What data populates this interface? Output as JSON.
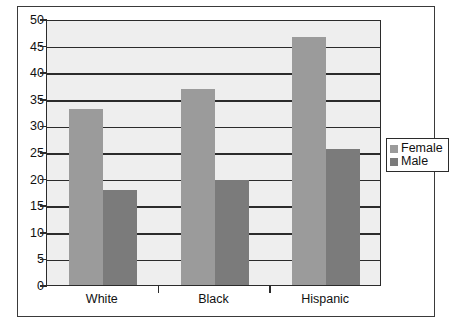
{
  "chart_data": {
    "type": "bar",
    "title": "",
    "subtitle": "",
    "xlabel": "",
    "ylabel": "",
    "categories": [
      "White",
      "Black",
      "Hispanic"
    ],
    "series": [
      {
        "name": "Female",
        "color": "#9b9b9b",
        "values": [
          33.1,
          36.9,
          46.6
        ]
      },
      {
        "name": "Male",
        "color": "#7b7b7b",
        "values": [
          17.9,
          19.7,
          25.5
        ]
      }
    ],
    "ylim": [
      0,
      50
    ],
    "yticks": [
      0,
      5,
      10,
      15,
      20,
      25,
      30,
      35,
      40,
      45,
      50
    ],
    "ytick_labels": [
      "0",
      "5",
      "10",
      "15",
      "20",
      "25",
      "30",
      "35",
      "40",
      "45",
      "50"
    ],
    "grid": true,
    "grid_axis": "y",
    "legend": [
      "Female",
      "Male"
    ],
    "legend_position": "right",
    "plot_background": "#eeeeee",
    "frame_color": "#2b2b2b"
  },
  "legend": {
    "items": [
      {
        "label": "Female"
      },
      {
        "label": "Male"
      }
    ]
  },
  "caption": {
    "partial_text": "____   ____   __   ___"
  }
}
